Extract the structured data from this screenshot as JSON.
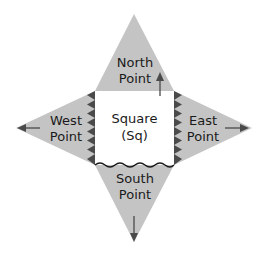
{
  "diagram": {
    "center": {
      "line1": "Square",
      "line2": "(Sq)"
    },
    "north": {
      "line1": "North",
      "line2": "Point"
    },
    "south": {
      "line1": "South",
      "line2": "Point"
    },
    "west": {
      "line1": "West",
      "line2": "Point"
    },
    "east": {
      "line1": "East",
      "line2": "Point"
    },
    "colors": {
      "flap_fill": "#c4c4c4",
      "square_fill": "#ffffff",
      "edge_mark": "#4a4a4a",
      "arrow": "#4a4a4a",
      "text": "#1a1a1a"
    }
  }
}
